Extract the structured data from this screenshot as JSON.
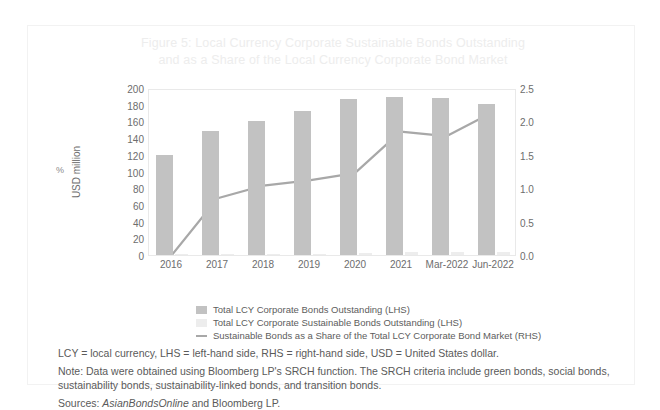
{
  "title": {
    "line1": "Figure 5: Local Currency Corporate Sustainable Bonds Outstanding",
    "line2": "and as a Share of the Local Currency Corporate Bond Market"
  },
  "axes": {
    "left_title": "USD million",
    "left_ticks": [
      "200",
      "180",
      "160",
      "140",
      "120",
      "100",
      "80",
      "60",
      "40",
      "20",
      "0"
    ],
    "right_ticks": [
      "2.5",
      "2.0",
      "1.5",
      "1.0",
      "0.5",
      "0.0"
    ],
    "right_unit": "%"
  },
  "legend": [
    {
      "label": "Total LCY Corporate Bonds Outstanding (LHS)",
      "swatch": "bar-dark",
      "color": "#c2c2c2"
    },
    {
      "label": "Total LCY Corporate Sustainable Bonds Outstanding (LHS)",
      "swatch": "bar-light",
      "color": "#ededed"
    },
    {
      "label": "Sustainable Bonds as a Share of the Total LCY Corporate Bond Market (RHS)",
      "swatch": "line",
      "color": "#a8a8a8"
    }
  ],
  "notes": {
    "abbrev": "LCY = local currency, LHS = left-hand side, RHS = right-hand side, USD = United States dollar.",
    "note": "Note: Data were obtained using Bloomberg LP's SRCH function. The SRCH criteria include green bonds, social bonds, sustainability bonds, sustainability-linked bonds, and transition bonds.",
    "sources_prefix": "Sources: ",
    "sources_italic": "AsianBondsOnline",
    "sources_suffix": " and Bloomberg LP."
  },
  "chart_data": {
    "type": "bar",
    "title": "Figure 5: Local Currency Corporate Sustainable Bonds Outstanding and as a Share of the Local Currency Corporate Bond Market",
    "xlabel": "",
    "ylabel": "USD million",
    "y2label": "%",
    "ylim": [
      0,
      200
    ],
    "y2lim": [
      0,
      2.5
    ],
    "grid": false,
    "legend_position": "bottom",
    "categories": [
      "2016",
      "2017",
      "2018",
      "2019",
      "2020",
      "2021",
      "Mar-2022",
      "Jun-2022"
    ],
    "series": [
      {
        "name": "Total LCY Corporate Bonds Outstanding (LHS)",
        "type": "bar",
        "axis": "left",
        "unit": "USD million",
        "color": "#c2c2c2",
        "values": [
          120,
          149,
          161,
          172,
          187,
          189,
          188,
          181
        ]
      },
      {
        "name": "Total LCY Corporate Sustainable Bonds Outstanding (LHS)",
        "type": "bar",
        "axis": "left",
        "unit": "USD million",
        "color": "#ededed",
        "values": [
          0.5,
          1.2,
          1.6,
          1.8,
          2.2,
          3.4,
          3.2,
          3.8
        ]
      },
      {
        "name": "Sustainable Bonds as a Share of the Total LCY Corporate Bond Market (RHS)",
        "type": "line",
        "axis": "right",
        "unit": "%",
        "color": "#a8a8a8",
        "values": [
          0.0,
          0.86,
          1.05,
          1.13,
          1.24,
          1.87,
          1.8,
          2.16
        ]
      }
    ]
  }
}
